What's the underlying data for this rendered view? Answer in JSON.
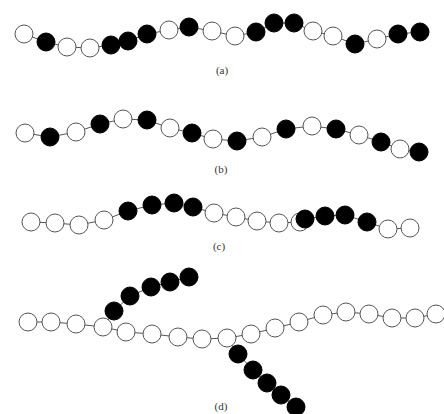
{
  "figure": {
    "panels": [
      {
        "id": "a",
        "label": "(a)",
        "label_pos": [
          222,
          72
        ],
        "description": "Random copolymer chain",
        "beads": [
          {
            "x": 24,
            "y": 34,
            "filled": false
          },
          {
            "x": 46,
            "y": 42,
            "filled": true
          },
          {
            "x": 67,
            "y": 47,
            "filled": false
          },
          {
            "x": 90,
            "y": 48,
            "filled": false
          },
          {
            "x": 111,
            "y": 45,
            "filled": true
          },
          {
            "x": 128,
            "y": 41,
            "filled": true
          },
          {
            "x": 147,
            "y": 34,
            "filled": true
          },
          {
            "x": 169,
            "y": 30,
            "filled": false
          },
          {
            "x": 189,
            "y": 27,
            "filled": true
          },
          {
            "x": 212,
            "y": 31,
            "filled": false
          },
          {
            "x": 235,
            "y": 36,
            "filled": false
          },
          {
            "x": 256,
            "y": 32,
            "filled": true
          },
          {
            "x": 274,
            "y": 23,
            "filled": true
          },
          {
            "x": 294,
            "y": 23,
            "filled": true
          },
          {
            "x": 313,
            "y": 31,
            "filled": false
          },
          {
            "x": 333,
            "y": 36,
            "filled": false
          },
          {
            "x": 355,
            "y": 44,
            "filled": true
          },
          {
            "x": 377,
            "y": 39,
            "filled": false
          },
          {
            "x": 398,
            "y": 34,
            "filled": true
          },
          {
            "x": 420,
            "y": 32,
            "filled": true
          }
        ]
      },
      {
        "id": "b",
        "label": "(b)",
        "label_pos": [
          221,
          171
        ],
        "description": "Alternating copolymer chain",
        "beads": [
          {
            "x": 25,
            "y": 133,
            "filled": false
          },
          {
            "x": 50,
            "y": 137,
            "filled": true
          },
          {
            "x": 76,
            "y": 132,
            "filled": false
          },
          {
            "x": 100,
            "y": 124,
            "filled": true
          },
          {
            "x": 123,
            "y": 119,
            "filled": false
          },
          {
            "x": 147,
            "y": 120,
            "filled": true
          },
          {
            "x": 170,
            "y": 128,
            "filled": false
          },
          {
            "x": 192,
            "y": 133,
            "filled": true
          },
          {
            "x": 213,
            "y": 139,
            "filled": false
          },
          {
            "x": 237,
            "y": 141,
            "filled": true
          },
          {
            "x": 262,
            "y": 137,
            "filled": false
          },
          {
            "x": 286,
            "y": 129,
            "filled": true
          },
          {
            "x": 312,
            "y": 126,
            "filled": false
          },
          {
            "x": 336,
            "y": 129,
            "filled": true
          },
          {
            "x": 359,
            "y": 135,
            "filled": false
          },
          {
            "x": 381,
            "y": 142,
            "filled": true
          },
          {
            "x": 400,
            "y": 149,
            "filled": false
          },
          {
            "x": 419,
            "y": 152,
            "filled": true
          }
        ]
      },
      {
        "id": "c",
        "label": "(c)",
        "label_pos": [
          219,
          248
        ],
        "description": "Block copolymer chain",
        "beads": [
          {
            "x": 31,
            "y": 222,
            "filled": false
          },
          {
            "x": 55,
            "y": 223,
            "filled": false
          },
          {
            "x": 79,
            "y": 225,
            "filled": false
          },
          {
            "x": 104,
            "y": 220,
            "filled": false
          },
          {
            "x": 128,
            "y": 211,
            "filled": true
          },
          {
            "x": 152,
            "y": 205,
            "filled": true
          },
          {
            "x": 174,
            "y": 203,
            "filled": true
          },
          {
            "x": 193,
            "y": 207,
            "filled": true
          },
          {
            "x": 214,
            "y": 213,
            "filled": false
          },
          {
            "x": 236,
            "y": 217,
            "filled": false
          },
          {
            "x": 257,
            "y": 221,
            "filled": false
          },
          {
            "x": 279,
            "y": 223,
            "filled": false
          },
          {
            "x": 300,
            "y": 222,
            "filled": false
          },
          {
            "x": 305,
            "y": 219,
            "filled": true
          },
          {
            "x": 325,
            "y": 216,
            "filled": true
          },
          {
            "x": 345,
            "y": 215,
            "filled": true
          },
          {
            "x": 367,
            "y": 222,
            "filled": true
          },
          {
            "x": 388,
            "y": 229,
            "filled": false
          },
          {
            "x": 410,
            "y": 228,
            "filled": false
          }
        ]
      },
      {
        "id": "d",
        "label": "(d)",
        "label_pos": [
          221,
          408
        ],
        "description": "Graft copolymer chain",
        "beads": [
          {
            "x": 28,
            "y": 322,
            "filled": false
          },
          {
            "x": 51,
            "y": 322,
            "filled": false
          },
          {
            "x": 76,
            "y": 324,
            "filled": false
          },
          {
            "x": 103,
            "y": 327,
            "filled": false
          },
          {
            "x": 126,
            "y": 332,
            "filled": false
          },
          {
            "x": 152,
            "y": 334,
            "filled": false
          },
          {
            "x": 178,
            "y": 337,
            "filled": false
          },
          {
            "x": 202,
            "y": 339,
            "filled": false
          },
          {
            "x": 227,
            "y": 338,
            "filled": false
          },
          {
            "x": 251,
            "y": 334,
            "filled": false
          },
          {
            "x": 275,
            "y": 328,
            "filled": false
          },
          {
            "x": 299,
            "y": 322,
            "filled": false
          },
          {
            "x": 323,
            "y": 315,
            "filled": false
          },
          {
            "x": 346,
            "y": 312,
            "filled": false
          },
          {
            "x": 369,
            "y": 314,
            "filled": false
          },
          {
            "x": 392,
            "y": 318,
            "filled": false
          },
          {
            "x": 415,
            "y": 318,
            "filled": false
          },
          {
            "x": 436,
            "y": 314,
            "filled": false
          }
        ],
        "branches": [
          {
            "from_index": 3,
            "beads": [
              {
                "x": 114,
                "y": 311,
                "filled": true
              },
              {
                "x": 130,
                "y": 296,
                "filled": true
              },
              {
                "x": 151,
                "y": 287,
                "filled": true
              },
              {
                "x": 170,
                "y": 282,
                "filled": true
              },
              {
                "x": 189,
                "y": 277,
                "filled": true
              }
            ]
          },
          {
            "from_index": 8,
            "beads": [
              {
                "x": 238,
                "y": 354,
                "filled": true
              },
              {
                "x": 253,
                "y": 370,
                "filled": true
              },
              {
                "x": 267,
                "y": 383,
                "filled": true
              },
              {
                "x": 281,
                "y": 395,
                "filled": true
              },
              {
                "x": 296,
                "y": 407,
                "filled": true
              }
            ]
          }
        ]
      }
    ],
    "bead_radius": 9,
    "colors": {
      "filled": "#000000",
      "open_fill": "#ffffff",
      "stroke": "#555555",
      "bond": "#555555"
    }
  }
}
